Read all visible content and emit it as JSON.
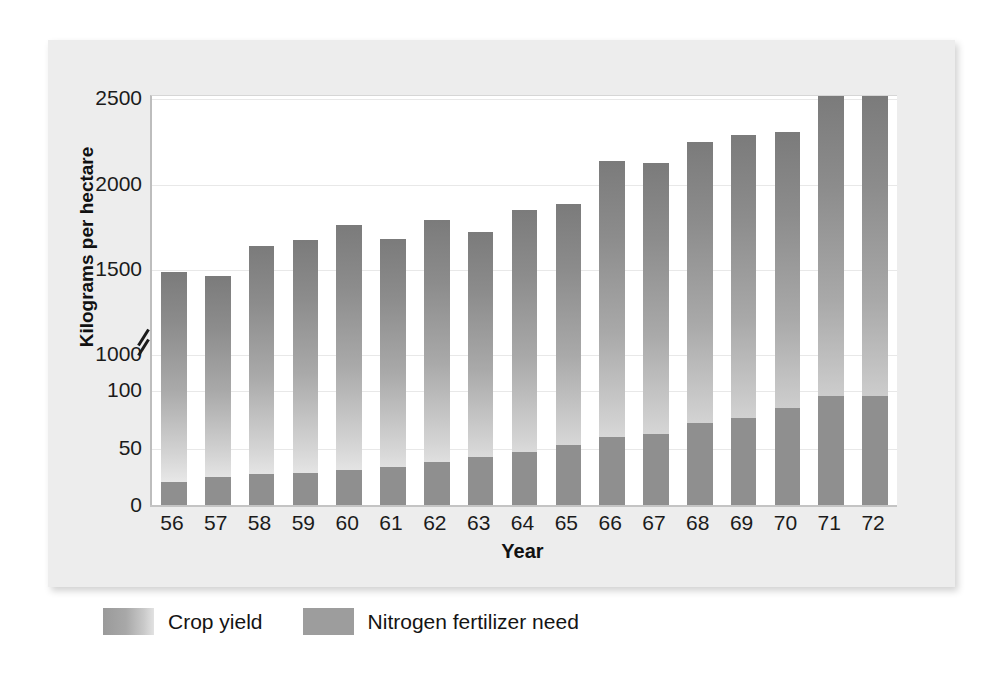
{
  "chart_data": {
    "type": "bar",
    "title": "",
    "xlabel": "Year",
    "ylabel": "Kilograms per hectare",
    "grid": true,
    "legend_position": "bottom-left",
    "broken_axis": true,
    "y_ticks_lower": [
      0,
      50,
      100
    ],
    "y_ticks_upper": [
      1000,
      1500,
      2000,
      2500
    ],
    "y_tick_labels": [
      "0",
      "50",
      "100",
      "1000",
      "1500",
      "2000",
      "2500"
    ],
    "ylim_lower": [
      0,
      115
    ],
    "ylim_upper": [
      950,
      2520
    ],
    "categories": [
      "56",
      "57",
      "58",
      "59",
      "60",
      "61",
      "62",
      "63",
      "64",
      "65",
      "66",
      "67",
      "68",
      "69",
      "70",
      "71",
      "72"
    ],
    "series": [
      {
        "name": "Crop yield",
        "color": "#9c9c9c",
        "style": "gradient",
        "values": [
          1490,
          1465,
          1640,
          1675,
          1765,
          1685,
          1795,
          1725,
          1850,
          1890,
          2140,
          2125,
          2250,
          2290,
          2310,
          2520,
          2520
        ]
      },
      {
        "name": "Nitrogen fertilizer need",
        "color": "#8f8f8f",
        "style": "solid",
        "values": [
          21,
          25,
          28,
          29,
          31,
          34,
          38,
          43,
          47,
          53,
          60,
          63,
          72,
          77,
          85,
          96,
          96
        ]
      }
    ]
  },
  "axes": {
    "y_title": "Kilograms per hectare",
    "x_title": "Year",
    "y_tick_labels": [
      "2500",
      "2000",
      "1500",
      "1000",
      "100",
      "50",
      "0"
    ],
    "x_tick_labels": [
      "56",
      "57",
      "58",
      "59",
      "60",
      "61",
      "62",
      "63",
      "64",
      "65",
      "66",
      "67",
      "68",
      "69",
      "70",
      "71",
      "72"
    ],
    "break_marker": "axis-break-slashes"
  },
  "legend": {
    "items": [
      {
        "label": "Crop yield",
        "swatch": "gradient-gray-swatch"
      },
      {
        "label": "Nitrogen fertilizer need",
        "swatch": "solid-gray-swatch"
      }
    ]
  },
  "colors": {
    "panel_background": "#ededed",
    "plot_background": "#ffffff",
    "gridline": "#e8e8e8",
    "axis": "#bdbdbd",
    "bar_yield": "#9c9c9c",
    "bar_nitrogen": "#8f8f8f",
    "text": "#1b1b1b"
  }
}
